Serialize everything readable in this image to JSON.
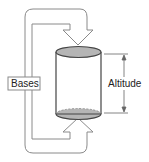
{
  "diagram": {
    "labels": {
      "bases": "Bases",
      "altitude": "Altitude"
    },
    "colors": {
      "base_fill": "#b5b5b5",
      "stroke": "#555555",
      "band_stroke": "#8a8a8a"
    }
  }
}
